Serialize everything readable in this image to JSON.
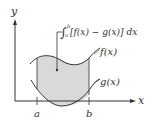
{
  "diagram": {
    "type": "area-between-curves",
    "axes": {
      "x_label": "x",
      "y_label": "y"
    },
    "ticks": {
      "a_label": "a",
      "b_label": "b"
    },
    "curves": {
      "upper_label": "f(x)",
      "lower_label": "g(x)"
    },
    "annotation": {
      "integral_lower": "a",
      "integral_upper": "b",
      "integrand": "[f(x) − g(x)] dx"
    },
    "colors": {
      "shade": "#d9d9d9",
      "stroke": "#333333",
      "background": "#ffffff"
    }
  }
}
